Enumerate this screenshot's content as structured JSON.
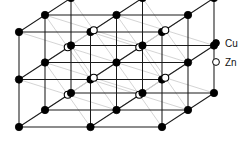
{
  "figure": {
    "kind": "crystal-lattice-diagram",
    "background_color": "#ffffff",
    "edge_color": "#1a1a1a",
    "diagonal_bond_color": "#c9c9c9",
    "atom_fill_color": "#000000",
    "atom_open_fill": "#ffffff",
    "atom_stroke_color": "#000000"
  },
  "legend": {
    "items": [
      {
        "marker": "filled-circle",
        "label": "Cu"
      },
      {
        "marker": "open-circle",
        "label": "Zn"
      }
    ]
  },
  "chart_data": {
    "type": "scatter",
    "title": "",
    "xlabel": "",
    "ylabel": "",
    "projection": {
      "origin": [
        19,
        127
      ],
      "ax": 71.5,
      "ay": 0,
      "bx": 0,
      "by": -47.5,
      "cx": 26,
      "cy": -17
    },
    "grid_counts": {
      "nx": 3,
      "ny": 3,
      "nz": 3
    },
    "legend_position": "right",
    "series": [
      {
        "name": "Cu",
        "marker": "filled-circle",
        "lattice_sites": [
          [
            0,
            0,
            0
          ],
          [
            2,
            0,
            0
          ],
          [
            0,
            2,
            0
          ],
          [
            2,
            2,
            0
          ],
          [
            1,
            1,
            0
          ],
          [
            0,
            0,
            2
          ],
          [
            2,
            0,
            2
          ],
          [
            0,
            2,
            2
          ],
          [
            2,
            2,
            2
          ],
          [
            1,
            1,
            2
          ],
          [
            0,
            1,
            1
          ],
          [
            1,
            0,
            1
          ],
          [
            2,
            1,
            1
          ],
          [
            1,
            2,
            1
          ],
          [
            0,
            0,
            1
          ],
          [
            2,
            0,
            1
          ],
          [
            0,
            2,
            1
          ],
          [
            2,
            2,
            1
          ],
          [
            1,
            1,
            1
          ],
          [
            1,
            0,
            0
          ],
          [
            0,
            1,
            0
          ],
          [
            2,
            1,
            0
          ],
          [
            1,
            2,
            0
          ],
          [
            1,
            0,
            2
          ],
          [
            0,
            1,
            2
          ],
          [
            2,
            1,
            2
          ],
          [
            1,
            2,
            2
          ]
        ]
      },
      {
        "name": "Zn",
        "marker": "open-circle",
        "body_centre_sites": [
          [
            0.5,
            0.5,
            0.5
          ],
          [
            1.5,
            0.5,
            0.5
          ],
          [
            0.5,
            1.5,
            0.5
          ],
          [
            1.5,
            1.5,
            0.5
          ],
          [
            0.5,
            0.5,
            1.5
          ],
          [
            1.5,
            0.5,
            1.5
          ],
          [
            0.5,
            1.5,
            1.5
          ],
          [
            1.5,
            1.5,
            1.5
          ]
        ]
      }
    ]
  }
}
